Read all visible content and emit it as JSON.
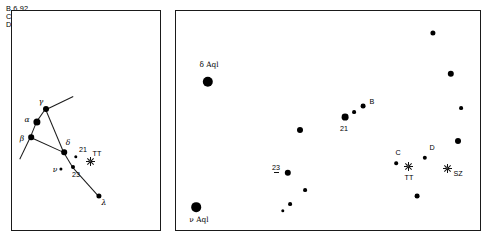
{
  "figure": {
    "background": "#ffffff",
    "ink": "#000000"
  },
  "legend": {
    "name": "comparison-star-magnitudes",
    "lines": [
      {
        "id": "B",
        "label": "B 6,92",
        "star": "B",
        "magnitude": "6,92"
      },
      {
        "id": "C",
        "label": "C 7,80",
        "star": "C",
        "magnitude": "7,80"
      },
      {
        "id": "D",
        "label": "D 8,4",
        "star": "D",
        "magnitude": "8,4"
      }
    ]
  },
  "panels": [
    {
      "id": "wide-field",
      "name": "panel-wide-field",
      "box": {
        "x": 11,
        "y": 10,
        "w": 150,
        "h": 221
      },
      "stars": [
        {
          "label": "γ",
          "label_style": "greek",
          "x": 46,
          "y": 109,
          "r": 3.0,
          "lx": 41,
          "ly": 102
        },
        {
          "label": "α",
          "label_style": "greek",
          "x": 37,
          "y": 122,
          "r": 3.6,
          "lx": 27,
          "ly": 120
        },
        {
          "label": "β",
          "label_style": "greek",
          "x": 31,
          "y": 137,
          "r": 2.8,
          "lx": 22,
          "ly": 139
        },
        {
          "label": "δ",
          "label_style": "greek",
          "x": 64,
          "y": 152,
          "r": 2.8,
          "lx": 68,
          "ly": 143
        },
        {
          "label": "21",
          "label_style": "sans",
          "x": 76,
          "y": 157,
          "r": 1.7,
          "lx": 83,
          "ly": 150
        },
        {
          "label": "23",
          "label_style": "sans",
          "x": 73,
          "y": 167,
          "r": 2.0,
          "lx": 76,
          "ly": 175
        },
        {
          "label": "ν",
          "label_style": "greek",
          "x": 61,
          "y": 169,
          "r": 1.6,
          "lx": 55,
          "ly": 170
        },
        {
          "label": "λ",
          "label_style": "greek",
          "x": 99,
          "y": 196,
          "r": 2.6,
          "lx": 104,
          "ly": 203
        }
      ],
      "lines": [
        {
          "x1": 46,
          "y1": 109,
          "x2": 37,
          "y2": 122
        },
        {
          "x1": 37,
          "y1": 122,
          "x2": 31,
          "y2": 137
        },
        {
          "x1": 46,
          "y1": 109,
          "x2": 64,
          "y2": 152
        },
        {
          "x1": 31,
          "y1": 137,
          "x2": 64,
          "y2": 152
        },
        {
          "x1": 64,
          "y1": 152,
          "x2": 73,
          "y2": 167
        },
        {
          "x1": 73,
          "y1": 167,
          "x2": 99,
          "y2": 196
        },
        {
          "x1": 46,
          "y1": 109,
          "x2": 73,
          "y2": 96
        },
        {
          "x1": 31,
          "y1": 137,
          "x2": 20,
          "y2": 160
        }
      ],
      "variables": [
        {
          "label": "TT",
          "x": 90,
          "y": 161,
          "lx": 97,
          "ly": 154
        }
      ]
    },
    {
      "id": "detail-field",
      "name": "panel-detail-field",
      "box": {
        "x": 175,
        "y": 10,
        "w": 306,
        "h": 221
      },
      "stars": [
        {
          "label": "δ Aql",
          "label_style": "serif",
          "x": 208,
          "y": 82,
          "r": 5.2,
          "lx": 209,
          "ly": 65
        },
        {
          "label": "ν Aql",
          "label_style": "serif",
          "x": 196,
          "y": 207,
          "r": 4.8,
          "lx": 199,
          "ly": 220
        },
        {
          "label": "",
          "x": 433,
          "y": 33,
          "r": 2.6
        },
        {
          "label": "",
          "x": 451,
          "y": 74,
          "r": 3.2
        },
        {
          "label": "",
          "x": 461,
          "y": 108,
          "r": 1.9
        },
        {
          "label": "",
          "x": 458,
          "y": 141,
          "r": 3.0
        },
        {
          "label": "B",
          "label_style": "sans",
          "x": 363,
          "y": 106,
          "r": 2.4,
          "lx": 372,
          "ly": 102
        },
        {
          "label": "21",
          "label_style": "sans",
          "x": 345,
          "y": 117,
          "r": 3.4,
          "lx": 344,
          "ly": 129
        },
        {
          "label": "",
          "x": 354,
          "y": 112,
          "r": 1.9
        },
        {
          "label": "",
          "x": 300,
          "y": 130,
          "r": 3.0
        },
        {
          "label": "23",
          "label_style": "sans",
          "x": 288,
          "y": 173,
          "r": 3.2,
          "lx": 276,
          "ly": 168
        },
        {
          "label": "",
          "x": 305,
          "y": 190,
          "r": 1.9
        },
        {
          "label": "",
          "x": 290,
          "y": 204,
          "r": 1.9
        },
        {
          "label": "",
          "x": 283,
          "y": 211,
          "r": 1.7
        },
        {
          "label": "C",
          "label_style": "sans",
          "x": 396,
          "y": 163,
          "r": 1.8,
          "lx": 398,
          "ly": 153
        },
        {
          "label": "D",
          "label_style": "sans",
          "x": 425,
          "y": 158,
          "r": 2.2,
          "lx": 432,
          "ly": 148
        },
        {
          "label": "",
          "x": 417,
          "y": 196,
          "r": 2.4
        }
      ],
      "variables": [
        {
          "label": "TT",
          "x": 408,
          "y": 166,
          "lx": 409,
          "ly": 178
        },
        {
          "label": "SZ",
          "x": 447,
          "y": 168,
          "lx": 458,
          "ly": 174
        }
      ]
    }
  ]
}
